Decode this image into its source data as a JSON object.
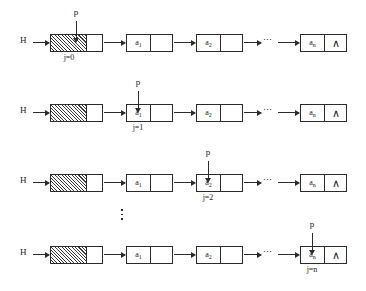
{
  "diagram": {
    "head_label": "H",
    "pointer_label": "p",
    "null_marker": "∧",
    "horizontal_ellipsis": "⋯",
    "vertical_ellipsis": "⋮",
    "nodes": {
      "head": {
        "data": "",
        "hatched": true
      },
      "item1": {
        "data": "a",
        "subscript": "1"
      },
      "item2": {
        "data": "a",
        "subscript": "2"
      },
      "itemn": {
        "data": "a",
        "subscript": "n"
      }
    },
    "rows": [
      {
        "pointer_label": "p",
        "index_label": "j=0",
        "target": "head"
      },
      {
        "pointer_label": "p",
        "index_label": "j=1",
        "target": "item1"
      },
      {
        "pointer_label": "p",
        "index_label": "j=2",
        "target": "item2"
      },
      {
        "pointer_label": "p",
        "index_label": "j=n",
        "target": "itemn"
      }
    ],
    "colors": {
      "ink": "#2b2b2b",
      "background": "#ffffff",
      "hatch": "#3a3a3a"
    }
  }
}
